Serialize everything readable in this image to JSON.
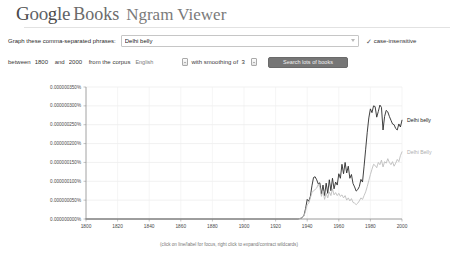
{
  "header": {
    "logo_letters": [
      "G",
      "o",
      "o",
      "g",
      "l",
      "e"
    ],
    "books_label": "Books",
    "product_label": "Ngram Viewer"
  },
  "form": {
    "phrases_label": "Graph these comma-separated phrases:",
    "phrases_value": "Delhi belly",
    "phrases_placeholder": "Delhi belly",
    "dropdown_icon": "chevron-down-icon",
    "case_insensitive_check": "✓",
    "case_insensitive_label": "case-insensitive",
    "between_label": "between",
    "year_start": "1800",
    "and_label": "and",
    "year_end": "2000",
    "corpus_label": "from the corpus",
    "corpus_value": "English",
    "smoothing_label": "with smoothing of",
    "smoothing_value": "3",
    "search_button_label": "Search lots of books"
  },
  "chart_data": {
    "type": "line",
    "title": "",
    "xlabel": "",
    "ylabel": "",
    "xlim": [
      1800,
      2000
    ],
    "ylim": [
      0,
      3.5e-07
    ],
    "grid": true,
    "legend_position": "right",
    "x_ticks": [
      "1800",
      "1820",
      "1840",
      "1860",
      "1880",
      "1900",
      "1920",
      "1940",
      "1960",
      "1980",
      "2000"
    ],
    "y_ticks": [
      "0.000000000%",
      "0.000000050%",
      "0.000000100%",
      "0.000000150%",
      "0.000000200%",
      "0.000000250%",
      "0.000000300%",
      "0.000000350%"
    ],
    "caption": "(click on line/label for focus, right click to expand/contract wildcards)",
    "series": [
      {
        "name": "Delhi belly",
        "color": "#2b2b2b",
        "x": [
          1800,
          1900,
          1925,
          1930,
          1934,
          1936,
          1937,
          1938,
          1939,
          1940,
          1941,
          1942,
          1943,
          1944,
          1945,
          1946,
          1947,
          1948,
          1949,
          1950,
          1951,
          1952,
          1953,
          1954,
          1955,
          1956,
          1957,
          1958,
          1959,
          1960,
          1961,
          1962,
          1963,
          1964,
          1965,
          1966,
          1967,
          1968,
          1969,
          1970,
          1971,
          1972,
          1973,
          1974,
          1975,
          1976,
          1977,
          1978,
          1979,
          1980,
          1981,
          1982,
          1983,
          1984,
          1985,
          1986,
          1987,
          1988,
          1989,
          1990,
          1991,
          1992,
          1993,
          1994,
          1995,
          1996,
          1997,
          1998,
          1999,
          2000
        ],
        "values": [
          0,
          0,
          0,
          0,
          0,
          2e-09,
          4e-09,
          1e-08,
          2.8e-08,
          5.2e-08,
          4.7e-08,
          6e-08,
          8.8e-08,
          1.1e-07,
          1.12e-07,
          1.04e-07,
          9.3e-08,
          9.6e-08,
          6.6e-08,
          9e-08,
          6.2e-08,
          9.5e-08,
          6.8e-08,
          1.04e-07,
          7.5e-08,
          1.08e-07,
          8e-08,
          9.8e-08,
          9e-08,
          1.2e-07,
          1.08e-07,
          1.45e-07,
          1.2e-07,
          1.5e-07,
          1.22e-07,
          1.4e-07,
          1.08e-07,
          1.18e-07,
          9.4e-08,
          8.5e-08,
          7.4e-08,
          7.8e-08,
          8.6e-08,
          1.05e-07,
          9.8e-08,
          1.4e-07,
          1.85e-07,
          2.3e-07,
          2.68e-07,
          2.92e-07,
          2.82e-07,
          3e-07,
          2.98e-07,
          2.7e-07,
          2.85e-07,
          3.02e-07,
          2.96e-07,
          2.36e-07,
          2.72e-07,
          2.88e-07,
          2.84e-07,
          2.72e-07,
          2.62e-07,
          2.52e-07,
          2.5e-07,
          2.4e-07,
          2.36e-07,
          2.52e-07,
          2.44e-07,
          2.62e-07
        ]
      },
      {
        "name": "Delhi Belly",
        "color": "#bdbdbd",
        "x": [
          1800,
          1900,
          1925,
          1930,
          1934,
          1936,
          1937,
          1938,
          1939,
          1940,
          1941,
          1942,
          1943,
          1944,
          1945,
          1946,
          1947,
          1948,
          1949,
          1950,
          1951,
          1952,
          1953,
          1954,
          1955,
          1956,
          1957,
          1958,
          1959,
          1960,
          1961,
          1962,
          1963,
          1964,
          1965,
          1966,
          1967,
          1968,
          1969,
          1970,
          1971,
          1972,
          1973,
          1974,
          1975,
          1976,
          1977,
          1978,
          1979,
          1980,
          1981,
          1982,
          1983,
          1984,
          1985,
          1986,
          1987,
          1988,
          1989,
          1990,
          1991,
          1992,
          1993,
          1994,
          1995,
          1996,
          1997,
          1998,
          1999,
          2000
        ],
        "values": [
          0,
          0,
          0,
          0,
          0,
          2e-09,
          4e-09,
          8e-09,
          2.2e-08,
          3.8e-08,
          4.2e-08,
          5.6e-08,
          7e-08,
          7.5e-08,
          7.8e-08,
          8.2e-08,
          9.2e-08,
          8.4e-08,
          6e-08,
          7.4e-08,
          5.2e-08,
          6.8e-08,
          5.6e-08,
          7.2e-08,
          6.2e-08,
          8e-08,
          6.4e-08,
          7e-08,
          6.2e-08,
          6.8e-08,
          6e-08,
          6.4e-08,
          5.6e-08,
          6.2e-08,
          5e-08,
          5.6e-08,
          4.8e-08,
          5.4e-08,
          4.4e-08,
          4.2e-08,
          3.8e-08,
          4.2e-08,
          4.8e-08,
          5.6e-08,
          5.2e-08,
          6.2e-08,
          7.2e-08,
          8.6e-08,
          1.02e-07,
          1.18e-07,
          1.32e-07,
          1.45e-07,
          1.42e-07,
          1.36e-07,
          1.5e-07,
          1.44e-07,
          1.56e-07,
          1.38e-07,
          1.52e-07,
          1.48e-07,
          1.6e-07,
          1.5e-07,
          1.44e-07,
          1.52e-07,
          1.4e-07,
          1.48e-07,
          1.58e-07,
          1.52e-07,
          1.68e-07,
          1.78e-07
        ]
      }
    ]
  }
}
